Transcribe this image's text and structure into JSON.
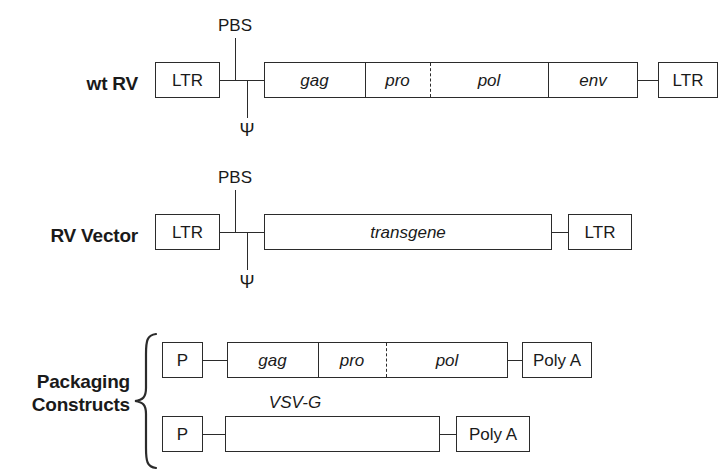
{
  "figure": {
    "line_color": "#2b2b2b",
    "text_color": "#1a1a1a",
    "background": "#ffffff"
  },
  "rows": {
    "wt_rv": {
      "label": "wt RV",
      "left_ltr": "LTR",
      "right_ltr": "LTR",
      "genes": [
        "gag",
        "pro",
        "pol",
        "env"
      ],
      "annotations": {
        "pbs": "PBS",
        "psi": "Ψ"
      }
    },
    "rv_vector": {
      "label": "RV Vector",
      "left_ltr": "LTR",
      "right_ltr": "LTR",
      "insert": "transgene",
      "annotations": {
        "pbs": "PBS",
        "psi": "Ψ"
      }
    },
    "packaging": {
      "label_line1": "Packaging",
      "label_line2": "Constructs",
      "construct_1": {
        "promoter": "P",
        "genes": [
          "gag",
          "pro",
          "pol"
        ],
        "terminator": "Poly A"
      },
      "construct_2": {
        "promoter": "P",
        "gene_label": "VSV-G",
        "terminator": "Poly A"
      }
    }
  }
}
